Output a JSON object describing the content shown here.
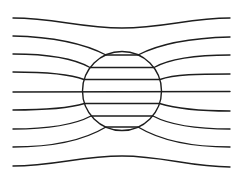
{
  "diagram": {
    "colors": {
      "background": "#ffffff",
      "stroke": "#1e1e1e"
    },
    "sphere": {
      "cx": 122,
      "cy": 91,
      "r": 39.5
    },
    "field_lines": [
      {
        "id": 1,
        "d": "M13,18 C55,18 80,28 122,28 C164,28 189,18 230,18"
      },
      {
        "id": 2,
        "d": "M13,36 C55,37 85,44 106,55 L138,55 C159,44 189,38 230,37"
      },
      {
        "id": 3,
        "d": "M13,54 C50,54 75,59 90,67.5 L154,67.5 C169,59 194,55 230,55"
      },
      {
        "id": 4,
        "d": "M13,72 C45,72 70,74 84,79.5 L160,79.5 C174,74 199,74 230,74"
      },
      {
        "id": 5,
        "d": "M13,92 L230,91.5"
      },
      {
        "id": 6,
        "d": "M13,110 C45,110 70,108 84.5,103.5 L159.5,103.5 C174,108 199,111 230,111"
      },
      {
        "id": 7,
        "d": "M13,129 C50,129 76,124 91,116 L153,116 C168,124 194,129 230,129"
      },
      {
        "id": 8,
        "d": "M13,147 C55,147 86,139 106,127 L138,127 C158,139 189,147 230,147"
      },
      {
        "id": 9,
        "d": "M13,166 C55,166 80,156 122,156 C164,156 189,167 230,167"
      }
    ]
  }
}
